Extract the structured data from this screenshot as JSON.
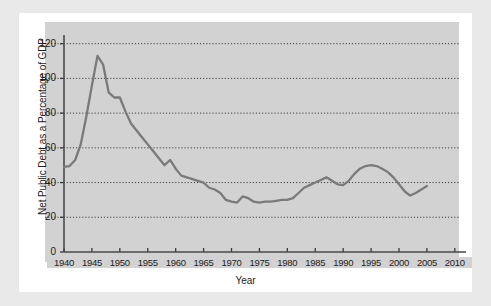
{
  "chart_data": {
    "type": "line",
    "title": "",
    "xlabel": "Year",
    "ylabel": "Net Public Debt as a Percentage of GDP",
    "xlim": [
      1940,
      2012
    ],
    "ylim": [
      0,
      125
    ],
    "grid": true,
    "legend": "none",
    "y_ticks": [
      0,
      20,
      40,
      60,
      80,
      100,
      120
    ],
    "x_ticks": [
      1940,
      1945,
      1950,
      1955,
      1960,
      1965,
      1970,
      1975,
      1980,
      1985,
      1990,
      1995,
      2000,
      2005,
      2010
    ],
    "x_tick_labels": [
      "1940",
      "1945",
      "1950",
      "1955",
      "1960",
      "1965",
      "1970",
      "1975",
      "1980",
      "1985",
      "1990",
      "1995",
      "2000",
      "2005",
      "2010"
    ],
    "y_tick_labels": [
      "0",
      "20",
      "40",
      "60",
      "80",
      "100",
      "120"
    ],
    "series": [
      {
        "name": "Net Public Debt as a Percentage of GDP",
        "color": "#7a7a7a",
        "x": [
          1940,
          1941,
          1942,
          1943,
          1944,
          1945,
          1946,
          1947,
          1948,
          1949,
          1950,
          1951,
          1952,
          1953,
          1954,
          1955,
          1956,
          1957,
          1958,
          1959,
          1960,
          1961,
          1962,
          1963,
          1964,
          1965,
          1966,
          1967,
          1968,
          1969,
          1970,
          1971,
          1972,
          1973,
          1974,
          1975,
          1976,
          1977,
          1978,
          1979,
          1980,
          1981,
          1982,
          1983,
          1984,
          1985,
          1986,
          1987,
          1988,
          1989,
          1990,
          1991,
          1992,
          1993,
          1994,
          1995,
          1996,
          1997,
          1998,
          1999,
          2000,
          2001,
          2002,
          2003,
          2004,
          2005
        ],
        "y": [
          49,
          49.5,
          53,
          62,
          78,
          96,
          113,
          108,
          92,
          89,
          89,
          81,
          74,
          70,
          66,
          62,
          58,
          54,
          50,
          53,
          48,
          44,
          43,
          42,
          41,
          40,
          37,
          36,
          34,
          30,
          29,
          28.5,
          32,
          31,
          29,
          28.5,
          29,
          29,
          29.5,
          30,
          30,
          31,
          34,
          37,
          38.5,
          40,
          41.5,
          43,
          41,
          39,
          38.5,
          41,
          45,
          48,
          49.5,
          50,
          49.5,
          48,
          46,
          43,
          39,
          35,
          32.5,
          34,
          36,
          38
        ]
      }
    ]
  },
  "axis": {
    "ylabel": "Net Public Debt as a Percentage of GDP",
    "xlabel": "Year"
  }
}
